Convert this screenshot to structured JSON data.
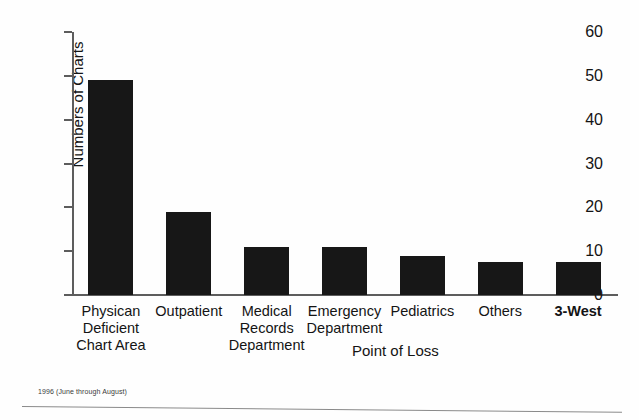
{
  "chart_data": {
    "type": "bar",
    "title": "",
    "xlabel": "Point of Loss",
    "ylabel": "Numbers of Charts",
    "ylim": [
      0,
      60
    ],
    "yticks": [
      0,
      10,
      20,
      30,
      40,
      50,
      60
    ],
    "grid": false,
    "legend": null,
    "categories": [
      "Physican Deficient Chart Area",
      "Outpatient",
      "Medical Records Department",
      "Emergency Department",
      "Pediatrics",
      "Others",
      "3-West"
    ],
    "category_lines": [
      [
        "Physican",
        "Deficient",
        "Chart Area"
      ],
      [
        "Outpatient"
      ],
      [
        "Medical",
        "Records",
        "Department"
      ],
      [
        "Emergency",
        "Department"
      ],
      [
        "Pediatrics"
      ],
      [
        "Others"
      ],
      [
        "3-West"
      ]
    ],
    "values": [
      49,
      19,
      11,
      11,
      9,
      7.5,
      7.5
    ],
    "bar_color": "#171717",
    "axis_color": "#5d5d5d"
  },
  "footnote": "1996 (June through August)"
}
